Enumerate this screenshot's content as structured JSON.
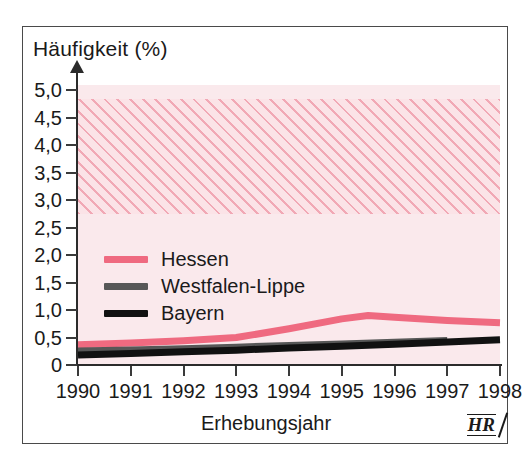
{
  "figure": {
    "y_axis_title": "Häufigkeit (%)",
    "x_axis_title": "Erhebungsjahr",
    "source_logo": "HR"
  },
  "colors": {
    "hessen": "#ef6a80",
    "westfalen_lippe": "#575757",
    "bayern": "#111111",
    "plot_background": "#fae9ec",
    "hatch_stripe": "#e9788c",
    "frame": "#4a4a4a",
    "axis": "#2b2b2b",
    "text": "#1a1a1a"
  },
  "legend": {
    "position": "inside-left",
    "entries": [
      {
        "label": "Hessen",
        "color": "#ef6a80"
      },
      {
        "label": "Westfalen-Lippe",
        "color": "#575757"
      },
      {
        "label": "Bayern",
        "color": "#111111"
      }
    ]
  },
  "chart_data": {
    "type": "line",
    "title": "",
    "xlabel": "Erhebungsjahr",
    "ylabel": "Häufigkeit (%)",
    "x": [
      1990,
      1991,
      1992,
      1993,
      1994,
      1995,
      1996,
      1997,
      1998
    ],
    "categories": [
      "1990",
      "1991",
      "1992",
      "1993",
      "1994",
      "1995",
      "1996",
      "1997",
      "1998"
    ],
    "xlim": [
      1990,
      1998
    ],
    "ylim": [
      0,
      5.1
    ],
    "yticks": [
      0,
      0.5,
      1.0,
      1.5,
      2.0,
      2.5,
      3.0,
      3.5,
      4.0,
      4.5,
      5.0
    ],
    "ytick_labels": [
      "0",
      "0,5",
      "1,0",
      "1,5",
      "2,0",
      "2,5",
      "3,0",
      "3,5",
      "4,0",
      "4,5",
      "5,0"
    ],
    "xtick_labels": [
      "1990",
      "1991",
      "1992",
      "1993",
      "1994",
      "1995",
      "1996",
      "1997",
      "1998"
    ],
    "grid": false,
    "series": [
      {
        "name": "Hessen",
        "color": "#ef6a80",
        "x": [
          1990,
          1991,
          1992,
          1993,
          1994,
          1995,
          1995.5,
          1996,
          1997,
          1998
        ],
        "values": [
          0.37,
          0.4,
          0.44,
          0.5,
          0.66,
          0.84,
          0.9,
          0.87,
          0.81,
          0.77
        ]
      },
      {
        "name": "Westfalen-Lippe",
        "color": "#575757",
        "x": [
          1990,
          1991,
          1992,
          1993,
          1994,
          1995,
          1996,
          1997
        ],
        "values": [
          0.25,
          0.27,
          0.29,
          0.32,
          0.35,
          0.38,
          0.41,
          0.44
        ]
      },
      {
        "name": "Bayern",
        "color": "#111111",
        "x": [
          1990,
          1991,
          1992,
          1993,
          1994,
          1995,
          1996,
          1997,
          1998
        ],
        "values": [
          0.18,
          0.21,
          0.24,
          0.27,
          0.31,
          0.34,
          0.38,
          0.42,
          0.46
        ]
      }
    ],
    "annotations": [
      {
        "name": "hatched-reference-band",
        "type": "hband",
        "y_from": 2.75,
        "y_to": 4.85,
        "style": "diagonal-hatch",
        "color": "#e9788c"
      }
    ]
  }
}
